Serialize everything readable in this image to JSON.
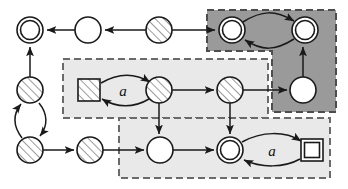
{
  "figure": {
    "type": "state-diagram",
    "width": 348,
    "height": 189,
    "background": "#ffffff",
    "stroke_color": "#1a1a1a",
    "hatch_fill": "#ffffff",
    "hatch_line_color": "#555555"
  },
  "regions": [
    {
      "id": "region-dark",
      "name": "dark-highlight-region",
      "shade": "#9a9a9a",
      "border": "#4d4d4d",
      "border_style": "dashed",
      "shape": "L-shape",
      "points": "207,10 336,10 336,112 272,112 272,51 207,51"
    },
    {
      "id": "region-middle",
      "name": "middle-highlight-region",
      "shade": "#e8e8e8",
      "border": "#666666",
      "border_style": "dashed",
      "shape": "rect",
      "x": 63,
      "y": 59,
      "w": 205,
      "h": 59
    },
    {
      "id": "region-bottom",
      "name": "bottom-highlight-region",
      "shade": "#e8e8e8",
      "border": "#666666",
      "border_style": "dashed",
      "shape": "rect",
      "x": 119,
      "y": 118,
      "w": 211,
      "h": 60
    }
  ],
  "nodes": [
    {
      "id": "n1",
      "name": "accepting-state-top-left",
      "shape": "double-circle",
      "fill": "white",
      "cx": 30,
      "cy": 30,
      "r": 13
    },
    {
      "id": "n2",
      "name": "state-top-white",
      "shape": "circle",
      "fill": "white",
      "cx": 88,
      "cy": 30,
      "r": 13
    },
    {
      "id": "n3",
      "name": "state-top-hatched",
      "shape": "circle",
      "fill": "hatched",
      "cx": 159,
      "cy": 30,
      "r": 13
    },
    {
      "id": "n4",
      "name": "accepting-state-dark-left",
      "shape": "double-circle",
      "fill": "white",
      "cx": 232,
      "cy": 30,
      "r": 13
    },
    {
      "id": "n5",
      "name": "accepting-state-dark-right",
      "shape": "double-circle",
      "fill": "white",
      "cx": 305,
      "cy": 30,
      "r": 13
    },
    {
      "id": "n6",
      "name": "state-left-upper-hatched",
      "shape": "circle",
      "fill": "hatched",
      "cx": 30,
      "cy": 90,
      "r": 13
    },
    {
      "id": "n7",
      "name": "state-left-lower-hatched",
      "shape": "circle",
      "fill": "hatched",
      "cx": 30,
      "cy": 150,
      "r": 13
    },
    {
      "id": "n8",
      "name": "start-square-hatched",
      "shape": "square",
      "fill": "hatched",
      "cx": 89,
      "cy": 90,
      "r": 11
    },
    {
      "id": "n9",
      "name": "state-middle-hatched-left",
      "shape": "circle",
      "fill": "hatched",
      "cx": 159,
      "cy": 90,
      "r": 13
    },
    {
      "id": "n10",
      "name": "state-middle-hatched-right",
      "shape": "circle",
      "fill": "hatched",
      "cx": 230,
      "cy": 90,
      "r": 13
    },
    {
      "id": "n11",
      "name": "state-dark-bottom-white",
      "shape": "circle",
      "fill": "white",
      "cx": 303,
      "cy": 90,
      "r": 13
    },
    {
      "id": "n12",
      "name": "state-bottom-hatched",
      "shape": "circle",
      "fill": "hatched",
      "cx": 90,
      "cy": 150,
      "r": 13
    },
    {
      "id": "n13",
      "name": "state-bottom-white",
      "shape": "circle",
      "fill": "white",
      "cx": 160,
      "cy": 150,
      "r": 13
    },
    {
      "id": "n14",
      "name": "accepting-state-bottom",
      "shape": "double-circle",
      "fill": "white",
      "cx": 230,
      "cy": 150,
      "r": 13
    },
    {
      "id": "n15",
      "name": "final-square-white",
      "shape": "square",
      "fill": "white",
      "cx": 312,
      "cy": 150,
      "r": 11
    }
  ],
  "edge_labels": [
    {
      "id": "lbl-a-middle",
      "name": "transition-label-a-middle",
      "text": "a",
      "x": 123,
      "y": 90
    },
    {
      "id": "lbl-a-bottom",
      "name": "transition-label-a-bottom",
      "text": "a",
      "x": 272,
      "y": 150
    }
  ],
  "edges": [
    {
      "from": "n2",
      "to": "n1",
      "style": "straight",
      "name": "edge-top-white-to-accepting"
    },
    {
      "from": "n3",
      "to": "n2",
      "style": "straight",
      "name": "edge-top-hatched-to-white"
    },
    {
      "from": "n3",
      "to": "n4",
      "style": "straight",
      "name": "edge-top-hatched-to-dark-left"
    },
    {
      "from": "n4",
      "to": "n5",
      "style": "curved-over",
      "name": "edge-dark-left-to-right"
    },
    {
      "from": "n5",
      "to": "n4",
      "style": "curved-under",
      "name": "edge-dark-right-to-left"
    },
    {
      "from": "n6",
      "to": "n1",
      "style": "straight",
      "name": "edge-left-upper-to-accepting"
    },
    {
      "from": "n7",
      "to": "n6",
      "style": "curved-left",
      "name": "edge-left-lower-to-upper"
    },
    {
      "from": "n6",
      "to": "n7",
      "style": "curved-right",
      "name": "edge-left-upper-to-lower"
    },
    {
      "from": "n8",
      "to": "n9",
      "style": "curved-over",
      "name": "edge-square-to-hatched-a"
    },
    {
      "from": "n9",
      "to": "n8",
      "style": "curved-under",
      "name": "edge-hatched-to-square-a"
    },
    {
      "from": "n9",
      "to": "n10",
      "style": "straight",
      "name": "edge-middle-hatched-left-to-right"
    },
    {
      "from": "n9",
      "to": "n13",
      "style": "straight",
      "name": "edge-middle-hatched-down"
    },
    {
      "from": "n10",
      "to": "n11",
      "style": "straight",
      "name": "edge-hatched-right-to-dark-white"
    },
    {
      "from": "n10",
      "to": "n14",
      "style": "straight",
      "name": "edge-hatched-right-down"
    },
    {
      "from": "n11",
      "to": "n5",
      "style": "straight",
      "name": "edge-dark-white-up"
    },
    {
      "from": "n7",
      "to": "n12",
      "style": "straight",
      "name": "edge-left-lower-to-bottom-hatched"
    },
    {
      "from": "n12",
      "to": "n13",
      "style": "straight",
      "name": "edge-bottom-hatched-to-white"
    },
    {
      "from": "n13",
      "to": "n14",
      "style": "straight",
      "name": "edge-bottom-white-to-accepting"
    },
    {
      "from": "n14",
      "to": "n15",
      "style": "curved-over",
      "name": "edge-accepting-to-square-a"
    },
    {
      "from": "n15",
      "to": "n14",
      "style": "curved-under",
      "name": "edge-square-to-accepting-a"
    }
  ]
}
